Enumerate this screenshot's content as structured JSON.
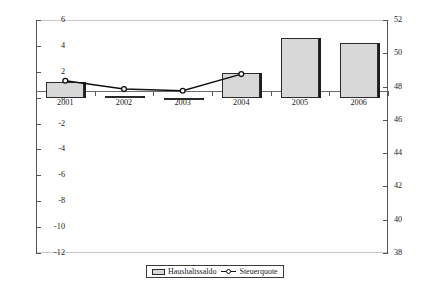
{
  "chart_data": {
    "type": "bar",
    "title": "",
    "xlabel": "",
    "ylabel": "",
    "categories": [
      "2001",
      "2002",
      "2003",
      "2004",
      "2005",
      "2006"
    ],
    "series": [
      {
        "name": "Haushaltssaldo",
        "type": "bar",
        "axis": "left",
        "values": [
          1.2,
          0.15,
          -0.2,
          1.9,
          4.6,
          4.25
        ]
      },
      {
        "name": "Steuerquote",
        "type": "line",
        "axis": "right",
        "values": [
          48.35,
          47.85,
          47.75,
          48.75,
          null,
          null
        ]
      }
    ],
    "left_axis": {
      "ticks": [
        "6",
        "4",
        "2",
        "0",
        "-2",
        "-4",
        "-6",
        "-8",
        "-10",
        "-12"
      ],
      "ylim": [
        -12,
        6
      ],
      "step": 2
    },
    "right_axis": {
      "ticks": [
        "52",
        "50",
        "48",
        "46",
        "44",
        "42",
        "40",
        "38"
      ],
      "ylim": [
        38,
        52
      ],
      "step": 2
    },
    "grid": false,
    "legend_position": "bottom-center",
    "colors": {
      "bar_fill": "#d8d8d8",
      "bar_border": "#2b2b2b",
      "line": "#111111",
      "axis": "#555555"
    }
  },
  "legend": {
    "bar_label": "Haushaltssaldo",
    "line_label": "Steuerquote"
  }
}
